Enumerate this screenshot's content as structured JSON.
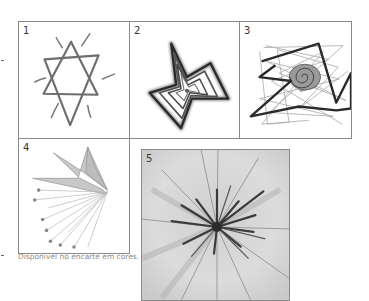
{
  "figure": {
    "panels": [
      {
        "number": "1",
        "description": "Hand-drawn six-pointed star (hexagram) with radiating strokes"
      },
      {
        "number": "2",
        "description": "Concentric five-pointed star drawing with layered outlines"
      },
      {
        "number": "3",
        "description": "Jagged polygon lines overlapping with a spiral shell in the center"
      },
      {
        "number": "4",
        "description": "Fan-like shape with rays converging to a point, small figures at ray ends"
      },
      {
        "number": "5",
        "description": "Dark radial burst drawing on a gray textured background"
      }
    ],
    "caption": "Disponível no encarte em cores."
  },
  "colors": {
    "border": "#8a8a8a",
    "line_dark": "#3a3a3a",
    "line_mid": "#7a7a7a",
    "line_light": "#b5b5b5",
    "panel5_bg": "#d8d8d8",
    "caption": "#8a8a8a"
  }
}
